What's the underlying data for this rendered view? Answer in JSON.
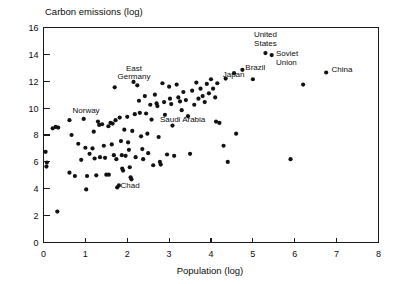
{
  "chart_data": {
    "type": "scatter",
    "title": "",
    "ylabel": "Carbon emissions (log)",
    "xlabel": "Population (log)",
    "xlim": [
      0,
      8
    ],
    "ylim": [
      0,
      16
    ],
    "xticks": [
      0,
      1,
      2,
      3,
      4,
      5,
      6,
      7,
      8
    ],
    "yticks": [
      0,
      2,
      4,
      6,
      8,
      10,
      12,
      14,
      16
    ],
    "xtick_labels": [
      "0",
      "1",
      "2",
      "3",
      "4",
      "5",
      "6",
      "7",
      "8"
    ],
    "ytick_labels": [
      "0",
      "2",
      "4",
      "6",
      "8",
      "10",
      "12",
      "14",
      "16"
    ],
    "grid": false,
    "legend": "none",
    "marker_color": "#121212",
    "marker_size": 2.1,
    "points": [
      {
        "x": 0.05,
        "y": 6.75
      },
      {
        "x": 0.08,
        "y": 5.95
      },
      {
        "x": 0.07,
        "y": 5.65
      },
      {
        "x": 0.33,
        "y": 2.3
      },
      {
        "x": 0.22,
        "y": 8.5
      },
      {
        "x": 0.29,
        "y": 8.6
      },
      {
        "x": 0.35,
        "y": 8.55
      },
      {
        "x": 0.62,
        "y": 9.1
      },
      {
        "x": 0.67,
        "y": 8.0
      },
      {
        "x": 0.62,
        "y": 5.2
      },
      {
        "x": 0.75,
        "y": 4.95
      },
      {
        "x": 0.83,
        "y": 7.35
      },
      {
        "x": 0.9,
        "y": 6.15
      },
      {
        "x": 0.96,
        "y": 9.2
      },
      {
        "x": 1.0,
        "y": 7.05
      },
      {
        "x": 1.04,
        "y": 4.95
      },
      {
        "x": 1.02,
        "y": 3.95
      },
      {
        "x": 1.1,
        "y": 6.6
      },
      {
        "x": 1.17,
        "y": 7.0
      },
      {
        "x": 1.2,
        "y": 8.25
      },
      {
        "x": 1.22,
        "y": 6.25
      },
      {
        "x": 1.26,
        "y": 5.0
      },
      {
        "x": 1.3,
        "y": 9.0
      },
      {
        "x": 1.33,
        "y": 8.75
      },
      {
        "x": 1.35,
        "y": 6.35
      },
      {
        "x": 1.4,
        "y": 8.8
      },
      {
        "x": 1.44,
        "y": 7.2
      },
      {
        "x": 1.47,
        "y": 6.3
      },
      {
        "x": 1.5,
        "y": 5.05
      },
      {
        "x": 1.56,
        "y": 5.05
      },
      {
        "x": 1.55,
        "y": 8.65
      },
      {
        "x": 1.6,
        "y": 8.9
      },
      {
        "x": 1.65,
        "y": 8.85
      },
      {
        "x": 1.63,
        "y": 7.3
      },
      {
        "x": 1.68,
        "y": 6.5
      },
      {
        "x": 1.7,
        "y": 11.55
      },
      {
        "x": 1.72,
        "y": 9.1
      },
      {
        "x": 1.74,
        "y": 6.2
      },
      {
        "x": 1.76,
        "y": 4.1
      },
      {
        "x": 1.8,
        "y": 4.25
      },
      {
        "x": 1.82,
        "y": 9.3
      },
      {
        "x": 1.85,
        "y": 7.55
      },
      {
        "x": 1.87,
        "y": 6.5
      },
      {
        "x": 1.88,
        "y": 5.5
      },
      {
        "x": 1.9,
        "y": 5.35
      },
      {
        "x": 1.93,
        "y": 8.4
      },
      {
        "x": 1.96,
        "y": 6.45
      },
      {
        "x": 2.0,
        "y": 9.35
      },
      {
        "x": 2.02,
        "y": 7.45
      },
      {
        "x": 2.04,
        "y": 6.9
      },
      {
        "x": 2.06,
        "y": 5.6
      },
      {
        "x": 2.08,
        "y": 4.85
      },
      {
        "x": 2.1,
        "y": 4.7
      },
      {
        "x": 2.12,
        "y": 8.3
      },
      {
        "x": 2.15,
        "y": 11.95
      },
      {
        "x": 2.18,
        "y": 9.55
      },
      {
        "x": 2.2,
        "y": 6.35
      },
      {
        "x": 2.24,
        "y": 11.7
      },
      {
        "x": 2.28,
        "y": 10.55
      },
      {
        "x": 2.3,
        "y": 9.65
      },
      {
        "x": 2.33,
        "y": 7.9
      },
      {
        "x": 2.36,
        "y": 6.95
      },
      {
        "x": 2.38,
        "y": 6.2
      },
      {
        "x": 2.42,
        "y": 10.9
      },
      {
        "x": 2.45,
        "y": 9.6
      },
      {
        "x": 2.48,
        "y": 8.1
      },
      {
        "x": 2.5,
        "y": 6.65
      },
      {
        "x": 2.55,
        "y": 10.25
      },
      {
        "x": 2.58,
        "y": 9.15
      },
      {
        "x": 2.62,
        "y": 5.75
      },
      {
        "x": 2.66,
        "y": 11.0
      },
      {
        "x": 2.7,
        "y": 10.35
      },
      {
        "x": 2.72,
        "y": 10.15
      },
      {
        "x": 2.75,
        "y": 7.85
      },
      {
        "x": 2.78,
        "y": 6.0
      },
      {
        "x": 2.8,
        "y": 5.8
      },
      {
        "x": 2.84,
        "y": 11.85
      },
      {
        "x": 2.88,
        "y": 10.45
      },
      {
        "x": 2.9,
        "y": 9.5
      },
      {
        "x": 2.95,
        "y": 6.55
      },
      {
        "x": 3.0,
        "y": 11.6
      },
      {
        "x": 3.02,
        "y": 10.7
      },
      {
        "x": 3.05,
        "y": 10.3
      },
      {
        "x": 3.08,
        "y": 8.7
      },
      {
        "x": 3.12,
        "y": 6.45
      },
      {
        "x": 3.18,
        "y": 11.75
      },
      {
        "x": 3.22,
        "y": 10.8
      },
      {
        "x": 3.26,
        "y": 10.5
      },
      {
        "x": 3.3,
        "y": 9.85
      },
      {
        "x": 3.34,
        "y": 11.2
      },
      {
        "x": 3.4,
        "y": 10.6
      },
      {
        "x": 3.45,
        "y": 9.4
      },
      {
        "x": 3.5,
        "y": 6.6
      },
      {
        "x": 3.55,
        "y": 11.3
      },
      {
        "x": 3.6,
        "y": 10.25
      },
      {
        "x": 3.65,
        "y": 11.9
      },
      {
        "x": 3.7,
        "y": 10.7
      },
      {
        "x": 3.75,
        "y": 11.45
      },
      {
        "x": 3.8,
        "y": 10.9
      },
      {
        "x": 3.85,
        "y": 10.45
      },
      {
        "x": 3.9,
        "y": 11.8
      },
      {
        "x": 3.95,
        "y": 11.1
      },
      {
        "x": 4.0,
        "y": 12.15
      },
      {
        "x": 4.05,
        "y": 11.45
      },
      {
        "x": 4.1,
        "y": 10.8
      },
      {
        "x": 4.12,
        "y": 9.0
      },
      {
        "x": 4.15,
        "y": 11.85
      },
      {
        "x": 4.2,
        "y": 8.9
      },
      {
        "x": 4.3,
        "y": 7.2
      },
      {
        "x": 4.35,
        "y": 12.2
      },
      {
        "x": 4.4,
        "y": 6.0
      },
      {
        "x": 4.55,
        "y": 12.6
      },
      {
        "x": 4.6,
        "y": 8.1
      },
      {
        "x": 4.75,
        "y": 12.85
      },
      {
        "x": 5.0,
        "y": 12.15
      },
      {
        "x": 5.3,
        "y": 14.1
      },
      {
        "x": 5.45,
        "y": 13.95
      },
      {
        "x": 5.9,
        "y": 6.2
      },
      {
        "x": 6.2,
        "y": 11.75
      },
      {
        "x": 6.75,
        "y": 12.65
      }
    ],
    "annotations": [
      {
        "label": "Norway",
        "x": 1.34,
        "y": 9.62,
        "anchor": "end",
        "align": "right"
      },
      {
        "label": "East",
        "x": 2.16,
        "y": 12.75,
        "anchor": "middle",
        "align": "center"
      },
      {
        "label": "Germany",
        "x": 2.16,
        "y": 12.15,
        "anchor": "middle",
        "align": "center"
      },
      {
        "label": "Saudi Arabia",
        "x": 2.78,
        "y": 8.95,
        "anchor": "start",
        "align": "left"
      },
      {
        "label": "Chad",
        "x": 1.84,
        "y": 4.02,
        "anchor": "start",
        "align": "left"
      },
      {
        "label": "Japan",
        "x": 4.28,
        "y": 12.35,
        "anchor": "start",
        "align": "left"
      },
      {
        "label": "Brazil",
        "x": 4.82,
        "y": 12.85,
        "anchor": "start",
        "align": "left"
      },
      {
        "label": "United",
        "x": 5.3,
        "y": 15.3,
        "anchor": "middle",
        "align": "center"
      },
      {
        "label": "States",
        "x": 5.3,
        "y": 14.65,
        "anchor": "middle",
        "align": "center"
      },
      {
        "label": "Soviet",
        "x": 5.55,
        "y": 13.85,
        "anchor": "start",
        "align": "left"
      },
      {
        "label": "Union",
        "x": 5.55,
        "y": 13.2,
        "anchor": "start",
        "align": "left"
      },
      {
        "label": "China",
        "x": 6.88,
        "y": 12.7,
        "anchor": "start",
        "align": "left"
      }
    ]
  }
}
